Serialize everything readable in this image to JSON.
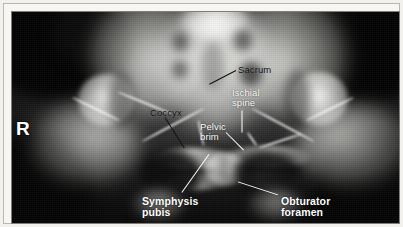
{
  "figure": {
    "kind": "x-ray-radiograph",
    "view": "anteroposterior pelvis",
    "border_color": "#b9b7b2",
    "film_background_color": "#070707",
    "bone_color": "#f2f2ef"
  },
  "side_marker": {
    "text": "R",
    "color": "#ffffff"
  },
  "annotations": [
    {
      "id": "sacrum",
      "text": "Sacrum",
      "lines": [
        "Sacrum"
      ],
      "style": "dark",
      "color": "#0b0b0b",
      "label_x": 234,
      "label_y": 61,
      "leader": {
        "x1": 232,
        "y1": 66,
        "x2": 205,
        "y2": 80,
        "color": "#111111"
      }
    },
    {
      "id": "ischial-spine",
      "text": "Ischial spine",
      "lines": [
        "Ischial",
        "spine"
      ],
      "style": "light",
      "color": "#ffffff",
      "label_x": 228,
      "label_y": 84,
      "leader": {
        "x1": 238,
        "y1": 106,
        "x2": 238,
        "y2": 128,
        "color": "#ffffff"
      }
    },
    {
      "id": "coccyx",
      "text": "Coccyx",
      "lines": [
        "Coccyx"
      ],
      "style": "dark",
      "color": "#0b0b0b",
      "label_x": 146,
      "label_y": 104,
      "leader": {
        "x1": 161,
        "y1": 113,
        "x2": 180,
        "y2": 143,
        "color": "#111111"
      }
    },
    {
      "id": "pelvic-brim",
      "text": "Pelvic brim",
      "lines": [
        "Pelvic",
        "brim"
      ],
      "style": "light",
      "color": "#ffffff",
      "label_x": 196,
      "label_y": 118,
      "leader": {
        "x1": 222,
        "y1": 128,
        "x2": 240,
        "y2": 146,
        "color": "#ffffff"
      }
    },
    {
      "id": "symphysis-pubis",
      "text": "Symphysis pubis",
      "lines": [
        "Symphysis",
        "pubis"
      ],
      "style": "light-bold",
      "color": "#ffffff",
      "label_x": 138,
      "label_y": 192,
      "leader": {
        "x1": 178,
        "y1": 188,
        "x2": 205,
        "y2": 150,
        "color": "#ffffff"
      }
    },
    {
      "id": "obturator-foramen",
      "text": "Obturator foramen",
      "lines": [
        "Obturator",
        "foramen"
      ],
      "style": "light-bold",
      "color": "#ffffff",
      "label_x": 277,
      "label_y": 192,
      "leader": {
        "x1": 274,
        "y1": 190,
        "x2": 234,
        "y2": 177,
        "color": "#ffffff"
      }
    }
  ]
}
